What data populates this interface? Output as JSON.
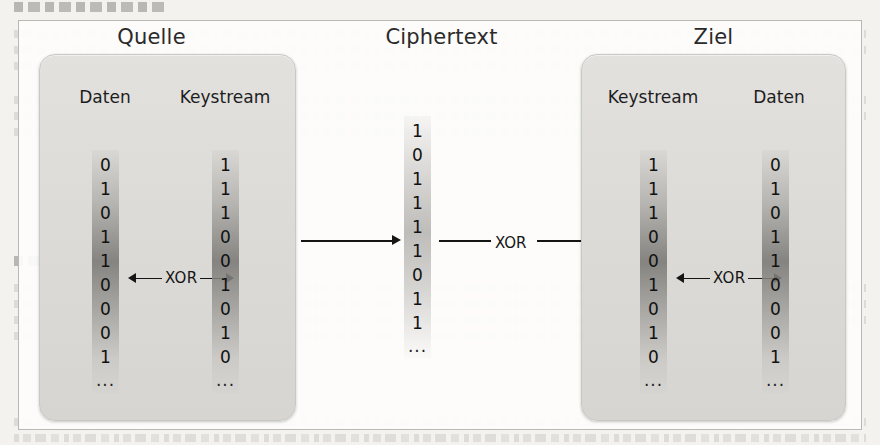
{
  "figure": {
    "titles": {
      "source": "Quelle",
      "middle": "Ciphertext",
      "target": "Ziel"
    },
    "source_panel": {
      "columns": [
        {
          "header": "Daten",
          "bits": [
            "0",
            "1",
            "0",
            "1",
            "1",
            "0",
            "0",
            "0",
            "1"
          ],
          "ellipsis": "..."
        },
        {
          "header": "Keystream",
          "bits": [
            "1",
            "1",
            "1",
            "0",
            "0",
            "1",
            "0",
            "1",
            "0"
          ],
          "ellipsis": "..."
        }
      ],
      "operation_label": "XOR"
    },
    "middle_panel": {
      "column": {
        "bits": [
          "1",
          "0",
          "1",
          "1",
          "1",
          "1",
          "0",
          "1",
          "1"
        ],
        "ellipsis": "..."
      },
      "transfer_label": "XOR"
    },
    "target_panel": {
      "columns": [
        {
          "header": "Keystream",
          "bits": [
            "1",
            "1",
            "1",
            "0",
            "0",
            "1",
            "0",
            "1",
            "0"
          ],
          "ellipsis": "..."
        },
        {
          "header": "Daten",
          "bits": [
            "0",
            "1",
            "0",
            "1",
            "1",
            "0",
            "0",
            "0",
            "1"
          ],
          "ellipsis": "..."
        }
      ],
      "operation_label": "XOR"
    },
    "colors": {
      "page_background": "#f3f2ef",
      "figure_background": "#fdfdfc",
      "figure_border": "#b9b8b4",
      "panel_fill": "#dcdbd8",
      "panel_border": "#c9c8c4",
      "bit_column_shade": "#807f7b",
      "text": "#111111",
      "arrow": "#151515"
    }
  }
}
